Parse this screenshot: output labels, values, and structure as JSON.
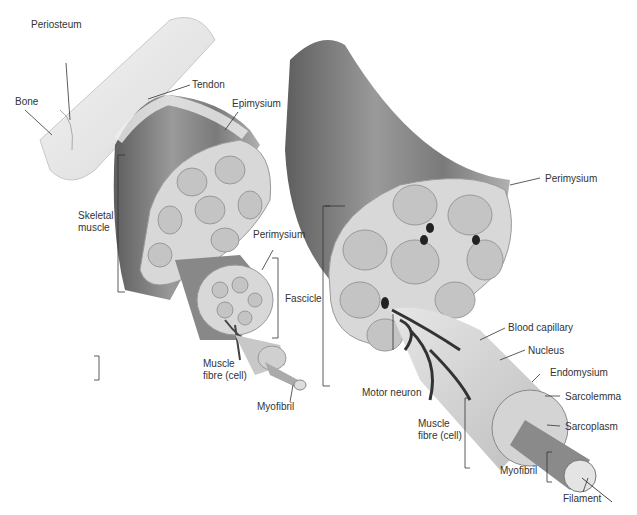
{
  "diagram": {
    "type": "anatomical illustration",
    "colors": {
      "muscle": "#8a8a8a",
      "tissue": "#d8d8d8",
      "bone": "#eeeeee",
      "line": "#333333"
    },
    "labels": {
      "periosteum": "Periosteum",
      "bone": "Bone",
      "tendon": "Tendon",
      "epimysium": "Epimysium",
      "skeletal_muscle_1": "Skeletal",
      "skeletal_muscle_2": "muscle",
      "perimysium_left": "Perimysium",
      "fascicle": "Fascicle",
      "muscle_fibre_left_1": "Muscle",
      "muscle_fibre_left_2": "fibre (cell)",
      "myofibril_left": "Myofibril",
      "perimysium_right": "Perimysium",
      "blood_capillary": "Blood capillary",
      "nucleus": "Nucleus",
      "motor_neuron": "Motor neuron",
      "endomysium": "Endomysium",
      "sarcolemma": "Sarcolemma",
      "sarcoplasm": "Sarcoplasm",
      "muscle_fibre_right_1": "Muscle",
      "muscle_fibre_right_2": "fibre (cell)",
      "myofibril_right": "Myofibril",
      "filament": "Filament"
    }
  }
}
